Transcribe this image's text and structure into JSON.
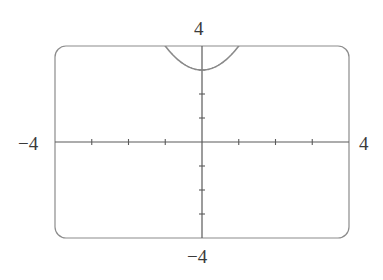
{
  "chart_data": {
    "type": "line",
    "title": "",
    "xlabel": "",
    "ylabel": "",
    "xlim": [
      -4,
      4
    ],
    "ylim": [
      -4,
      4
    ],
    "x_tick_step": 1,
    "y_tick_step": 1,
    "grid": false,
    "legend": null,
    "series": [
      {
        "name": "y = x^2 + 3",
        "expression": "x^2 + 3",
        "x": [
          -1.0,
          -0.75,
          -0.5,
          -0.25,
          0.0,
          0.25,
          0.5,
          0.75,
          1.0
        ],
        "values": [
          4.0,
          3.5625,
          3.25,
          3.0625,
          3.0,
          3.0625,
          3.25,
          3.5625,
          4.0
        ]
      }
    ],
    "window_labels": {
      "xmin": "−4",
      "xmax": "4",
      "ymin": "−4",
      "ymax": "4"
    }
  },
  "colors": {
    "frame": "#8c8c8c",
    "axes": "#5a5a5a",
    "curve": "#8a8a8a",
    "text": "#3a3a3a"
  }
}
